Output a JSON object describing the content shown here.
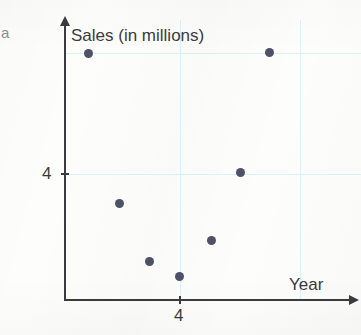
{
  "figure": {
    "corner_label": "a",
    "background_color": "#fdfdfc",
    "point_color": "#4d5266",
    "axis_color": "#3b3b3f",
    "gridline_color": "#d8f2f6",
    "text_color": "#3a3a3e"
  },
  "chart_data": {
    "type": "scatter",
    "title": "",
    "xlabel": "Year",
    "ylabel": "Sales (in millions)",
    "x_tick_labels": [
      "4"
    ],
    "y_tick_labels": [
      "4"
    ],
    "grid": true,
    "legend": "none",
    "axis_style": "arrow-axes",
    "xlim": [
      0,
      8
    ],
    "ylim": [
      0,
      8
    ],
    "points": [
      {
        "x": 1.0,
        "y": 7.0,
        "px": 88,
        "py": 53
      },
      {
        "x": 7.1,
        "y": 7.0,
        "px": 269,
        "py": 52
      },
      {
        "x": 5.9,
        "y": 4.1,
        "px": 240,
        "py": 172
      },
      {
        "x": 1.8,
        "y": 3.1,
        "px": 119,
        "py": 203
      },
      {
        "x": 4.9,
        "y": 2.0,
        "px": 211,
        "py": 240
      },
      {
        "x": 2.8,
        "y": 1.4,
        "px": 149,
        "py": 261
      },
      {
        "x": 4.0,
        "y": 1.0,
        "px": 179,
        "py": 276
      }
    ],
    "gridlines": {
      "horizontal_px": [
        53,
        174
      ],
      "vertical_px": [
        180,
        300
      ]
    }
  },
  "axes": {
    "origin_px": {
      "x": 65,
      "y": 300
    },
    "y_top_px": 20,
    "x_right_px": 355,
    "y_tick_px": 174,
    "x_tick_px": 180
  }
}
